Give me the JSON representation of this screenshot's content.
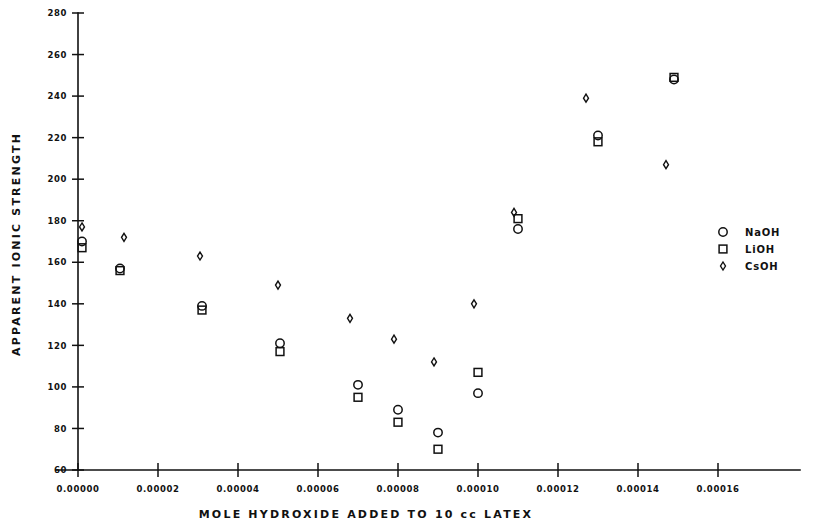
{
  "chart_data": {
    "type": "scatter",
    "title": "",
    "xlabel": "MOLE HYDROXIDE ADDED TO 10 cc LATEX",
    "ylabel": "APPARENT IONIC STRENGTH",
    "xlim": [
      0.0,
      0.00016
    ],
    "ylim": [
      60,
      280
    ],
    "grid": false,
    "legend_position": "right",
    "xticks": [
      0.0,
      2e-05,
      4e-05,
      6e-05,
      8e-05,
      0.0001,
      0.00012,
      0.00014,
      0.00016
    ],
    "xtick_labels": [
      "0.00000",
      "0.00002",
      "0.00004",
      "0.00006",
      "0.00008",
      "0.00010",
      "0.00012",
      "0.00014",
      "0.00016"
    ],
    "yticks": [
      60,
      80,
      100,
      120,
      140,
      160,
      180,
      200,
      220,
      240,
      260,
      280
    ],
    "ytick_labels": [
      "60",
      "80",
      "100",
      "120",
      "140",
      "160",
      "180",
      "200",
      "220",
      "240",
      "260",
      "280"
    ],
    "series": [
      {
        "name": "NaOH",
        "marker": "circle",
        "color": "#111111",
        "points": [
          {
            "x": 1e-06,
            "y": 170
          },
          {
            "x": 1.05e-05,
            "y": 157
          },
          {
            "x": 3.1e-05,
            "y": 139
          },
          {
            "x": 5.05e-05,
            "y": 121
          },
          {
            "x": 7e-05,
            "y": 101
          },
          {
            "x": 8e-05,
            "y": 89
          },
          {
            "x": 9e-05,
            "y": 78
          },
          {
            "x": 0.0001,
            "y": 97
          },
          {
            "x": 0.00011,
            "y": 176
          },
          {
            "x": 0.00013,
            "y": 221
          },
          {
            "x": 0.000149,
            "y": 248
          }
        ]
      },
      {
        "name": "LiOH",
        "marker": "square",
        "color": "#111111",
        "points": [
          {
            "x": 1e-06,
            "y": 167
          },
          {
            "x": 1.05e-05,
            "y": 156
          },
          {
            "x": 3.1e-05,
            "y": 137
          },
          {
            "x": 5.05e-05,
            "y": 117
          },
          {
            "x": 7e-05,
            "y": 95
          },
          {
            "x": 8e-05,
            "y": 83
          },
          {
            "x": 9e-05,
            "y": 70
          },
          {
            "x": 0.0001,
            "y": 107
          },
          {
            "x": 0.00011,
            "y": 181
          },
          {
            "x": 0.00013,
            "y": 218
          },
          {
            "x": 0.000149,
            "y": 249
          }
        ]
      },
      {
        "name": "CsOH",
        "marker": "diamond",
        "color": "#111111",
        "points": [
          {
            "x": 1e-06,
            "y": 177
          },
          {
            "x": 1.15e-05,
            "y": 172
          },
          {
            "x": 3.05e-05,
            "y": 163
          },
          {
            "x": 5e-05,
            "y": 149
          },
          {
            "x": 6.8e-05,
            "y": 133
          },
          {
            "x": 7.9e-05,
            "y": 123
          },
          {
            "x": 8.9e-05,
            "y": 112
          },
          {
            "x": 9.9e-05,
            "y": 140
          },
          {
            "x": 0.000109,
            "y": 184
          },
          {
            "x": 0.000127,
            "y": 239
          },
          {
            "x": 0.000147,
            "y": 207
          }
        ]
      }
    ]
  },
  "legend": {
    "items": [
      {
        "label": "NaOH",
        "marker": "circle"
      },
      {
        "label": "LiOH",
        "marker": "square"
      },
      {
        "label": "CsOH",
        "marker": "diamond"
      }
    ]
  }
}
